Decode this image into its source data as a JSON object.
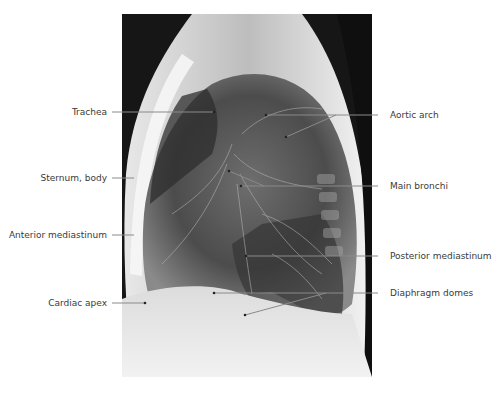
{
  "figure": {
    "labels_left": [
      {
        "id": "trachea",
        "text": "Trachea"
      },
      {
        "id": "sternum-body",
        "text": "Sternum, body"
      },
      {
        "id": "anterior-mediastinum",
        "text": "Anterior mediastinum"
      },
      {
        "id": "cardiac-apex",
        "text": "Cardiac apex"
      }
    ],
    "labels_right": [
      {
        "id": "aortic-arch",
        "text": "Aortic arch"
      },
      {
        "id": "main-bronchi",
        "text": "Main bronchi"
      },
      {
        "id": "posterior-mediastinum",
        "text": "Posterior mediastinum"
      },
      {
        "id": "diaphragm-domes",
        "text": "Diaphragm domes"
      }
    ]
  }
}
